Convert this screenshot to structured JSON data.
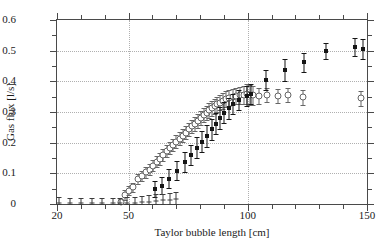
{
  "chart_data": {
    "type": "scatter",
    "title": "",
    "xlabel": "Taylor bubble length [cm]",
    "ylabel": "Gas flux [l/s]",
    "xlim": [
      20,
      150
    ],
    "ylim": [
      0,
      0.6
    ],
    "xticks": [
      20,
      50,
      100,
      150
    ],
    "xtick_labels": [
      "20",
      "50",
      "100",
      "150"
    ],
    "yticks": [
      0,
      0.1,
      0.2,
      0.3,
      0.4,
      0.5,
      0.6
    ],
    "ytick_labels": [
      "0",
      "0.1",
      "0.2",
      "0.3",
      "0.4",
      "0.5",
      "0.6"
    ],
    "x_minor_step": 10,
    "y_minor_step": 0.05,
    "grid": true,
    "grid_style": "dotted",
    "legend": "none",
    "series": [
      {
        "name": "open-circle-series",
        "marker": "open-circle",
        "color": "#666666",
        "points": [
          {
            "x": 47.0,
            "y": 0.005,
            "err": 0.012
          },
          {
            "x": 48.5,
            "y": 0.03,
            "err": 0.016
          },
          {
            "x": 50.2,
            "y": 0.043,
            "err": 0.015
          },
          {
            "x": 52.0,
            "y": 0.055,
            "err": 0.015
          },
          {
            "x": 54.0,
            "y": 0.082,
            "err": 0.017
          },
          {
            "x": 55.5,
            "y": 0.092,
            "err": 0.016
          },
          {
            "x": 57.2,
            "y": 0.103,
            "err": 0.018
          },
          {
            "x": 58.8,
            "y": 0.112,
            "err": 0.017
          },
          {
            "x": 60.3,
            "y": 0.125,
            "err": 0.018
          },
          {
            "x": 61.8,
            "y": 0.138,
            "err": 0.018
          },
          {
            "x": 63.2,
            "y": 0.147,
            "err": 0.019
          },
          {
            "x": 64.6,
            "y": 0.16,
            "err": 0.019
          },
          {
            "x": 66.0,
            "y": 0.172,
            "err": 0.02
          },
          {
            "x": 67.4,
            "y": 0.183,
            "err": 0.02
          },
          {
            "x": 68.8,
            "y": 0.192,
            "err": 0.02
          },
          {
            "x": 70.1,
            "y": 0.203,
            "err": 0.021
          },
          {
            "x": 71.5,
            "y": 0.213,
            "err": 0.021
          },
          {
            "x": 72.8,
            "y": 0.222,
            "err": 0.021
          },
          {
            "x": 74.1,
            "y": 0.233,
            "err": 0.022
          },
          {
            "x": 75.4,
            "y": 0.243,
            "err": 0.022
          },
          {
            "x": 76.7,
            "y": 0.253,
            "err": 0.022
          },
          {
            "x": 78.0,
            "y": 0.262,
            "err": 0.023
          },
          {
            "x": 79.2,
            "y": 0.272,
            "err": 0.023
          },
          {
            "x": 80.4,
            "y": 0.281,
            "err": 0.023
          },
          {
            "x": 81.6,
            "y": 0.29,
            "err": 0.024
          },
          {
            "x": 82.8,
            "y": 0.297,
            "err": 0.024
          },
          {
            "x": 83.9,
            "y": 0.305,
            "err": 0.024
          },
          {
            "x": 85.0,
            "y": 0.312,
            "err": 0.024
          },
          {
            "x": 86.1,
            "y": 0.318,
            "err": 0.025
          },
          {
            "x": 87.2,
            "y": 0.325,
            "err": 0.025
          },
          {
            "x": 88.4,
            "y": 0.33,
            "err": 0.025
          },
          {
            "x": 89.6,
            "y": 0.336,
            "err": 0.026
          },
          {
            "x": 90.8,
            "y": 0.341,
            "err": 0.026
          },
          {
            "x": 92.2,
            "y": 0.345,
            "err": 0.026
          },
          {
            "x": 93.6,
            "y": 0.348,
            "err": 0.026
          },
          {
            "x": 95.2,
            "y": 0.352,
            "err": 0.027
          },
          {
            "x": 96.8,
            "y": 0.354,
            "err": 0.028
          },
          {
            "x": 98.4,
            "y": 0.356,
            "err": 0.03
          },
          {
            "x": 99.6,
            "y": 0.358,
            "err": 0.032
          },
          {
            "x": 100.8,
            "y": 0.356,
            "err": 0.033
          },
          {
            "x": 102.0,
            "y": 0.354,
            "err": 0.03
          },
          {
            "x": 104.5,
            "y": 0.352,
            "err": 0.026
          },
          {
            "x": 108.0,
            "y": 0.355,
            "err": 0.024
          },
          {
            "x": 112.5,
            "y": 0.352,
            "err": 0.024
          },
          {
            "x": 117.0,
            "y": 0.356,
            "err": 0.023
          },
          {
            "x": 123.0,
            "y": 0.348,
            "err": 0.024
          },
          {
            "x": 147.5,
            "y": 0.345,
            "err": 0.024
          }
        ]
      },
      {
        "name": "filled-square-series",
        "marker": "filled-square",
        "color": "#151515",
        "points": [
          {
            "x": 61.0,
            "y": 0.048,
            "err": 0.026
          },
          {
            "x": 64.0,
            "y": 0.06,
            "err": 0.028
          },
          {
            "x": 67.0,
            "y": 0.083,
            "err": 0.03
          },
          {
            "x": 70.5,
            "y": 0.108,
            "err": 0.031
          },
          {
            "x": 73.5,
            "y": 0.138,
            "err": 0.033
          },
          {
            "x": 76.0,
            "y": 0.16,
            "err": 0.032
          },
          {
            "x": 78.5,
            "y": 0.183,
            "err": 0.034
          },
          {
            "x": 80.8,
            "y": 0.203,
            "err": 0.034
          },
          {
            "x": 83.0,
            "y": 0.222,
            "err": 0.035
          },
          {
            "x": 85.0,
            "y": 0.243,
            "err": 0.035
          },
          {
            "x": 86.8,
            "y": 0.262,
            "err": 0.035
          },
          {
            "x": 88.5,
            "y": 0.281,
            "err": 0.035
          },
          {
            "x": 90.2,
            "y": 0.297,
            "err": 0.034
          },
          {
            "x": 92.0,
            "y": 0.312,
            "err": 0.034
          },
          {
            "x": 94.0,
            "y": 0.325,
            "err": 0.033
          },
          {
            "x": 96.5,
            "y": 0.34,
            "err": 0.033
          },
          {
            "x": 99.5,
            "y": 0.352,
            "err": 0.034
          },
          {
            "x": 101.5,
            "y": 0.358,
            "err": 0.033
          },
          {
            "x": 107.5,
            "y": 0.405,
            "err": 0.033
          },
          {
            "x": 115.5,
            "y": 0.437,
            "err": 0.035
          },
          {
            "x": 123.5,
            "y": 0.462,
            "err": 0.032
          },
          {
            "x": 133.0,
            "y": 0.498,
            "err": 0.026
          },
          {
            "x": 145.0,
            "y": 0.512,
            "err": 0.03
          },
          {
            "x": 148.5,
            "y": 0.505,
            "err": 0.032
          }
        ]
      },
      {
        "name": "baseline-tick-series",
        "marker": "tick",
        "color": "#3c3c3c",
        "points": [
          {
            "x": 21.0,
            "y": 0.004,
            "err": 0.018
          },
          {
            "x": 25.5,
            "y": 0.004,
            "err": 0.016
          },
          {
            "x": 30.0,
            "y": 0.004,
            "err": 0.016
          },
          {
            "x": 34.5,
            "y": 0.004,
            "err": 0.016
          },
          {
            "x": 39.0,
            "y": 0.004,
            "err": 0.016
          },
          {
            "x": 43.5,
            "y": 0.004,
            "err": 0.017
          },
          {
            "x": 46.5,
            "y": 0.004,
            "err": 0.017
          },
          {
            "x": 49.5,
            "y": 0.004,
            "err": 0.018
          },
          {
            "x": 52.5,
            "y": 0.004,
            "err": 0.018
          },
          {
            "x": 55.5,
            "y": 0.006,
            "err": 0.019
          },
          {
            "x": 58.5,
            "y": 0.008,
            "err": 0.02
          },
          {
            "x": 61.5,
            "y": 0.01,
            "err": 0.021
          },
          {
            "x": 64.5,
            "y": 0.012,
            "err": 0.022
          },
          {
            "x": 67.5,
            "y": 0.014,
            "err": 0.022
          },
          {
            "x": 70.0,
            "y": 0.016,
            "err": 0.022
          }
        ]
      }
    ]
  }
}
